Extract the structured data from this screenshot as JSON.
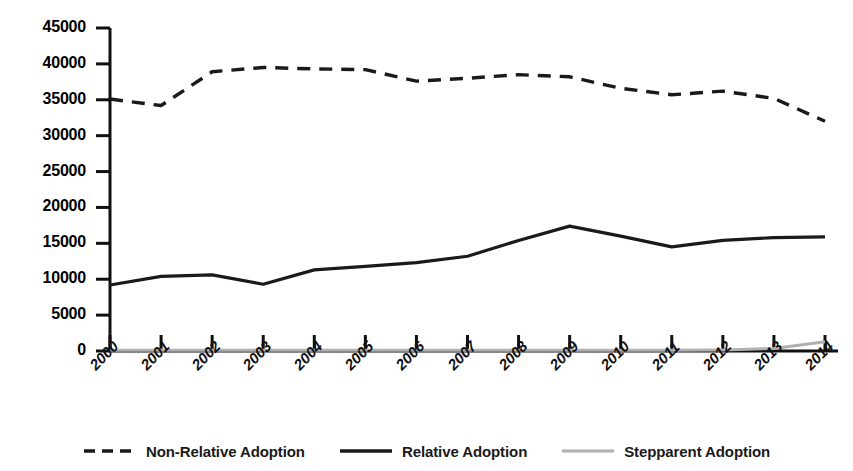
{
  "chart_data": {
    "type": "line",
    "title": "",
    "xlabel": "",
    "ylabel": "",
    "categories": [
      "2000",
      "2001",
      "2002",
      "2003",
      "2004",
      "2005",
      "2006",
      "2007",
      "2008",
      "2009",
      "2010",
      "2011",
      "2012",
      "2013",
      "2014"
    ],
    "ylim": [
      0,
      45000
    ],
    "yticks": [
      0,
      5000,
      10000,
      15000,
      20000,
      25000,
      30000,
      35000,
      40000,
      45000
    ],
    "ytick_labels": [
      "0",
      "5000",
      "10000",
      "15000",
      "20000",
      "25000",
      "30000",
      "35000",
      "40000",
      "45000"
    ],
    "grid": false,
    "legend_position": "bottom",
    "series": [
      {
        "name": "Non-Relative Adoption",
        "style": "dashed",
        "color": "#1a1a1a",
        "values": [
          35100,
          34200,
          38900,
          39500,
          39300,
          39200,
          37600,
          38000,
          38500,
          38200,
          36600,
          35700,
          36200,
          35200,
          32000
        ]
      },
      {
        "name": "Relative Adoption",
        "style": "solid",
        "color": "#1a1a1a",
        "values": [
          9200,
          10400,
          10600,
          9300,
          11300,
          11800,
          12300,
          13200,
          15400,
          17400,
          16000,
          14500,
          15400,
          15800,
          15900
        ]
      },
      {
        "name": "Stepparent Adoption",
        "style": "solid",
        "color": "#b0b0b0",
        "values": [
          100,
          100,
          100,
          100,
          100,
          100,
          100,
          100,
          100,
          100,
          100,
          100,
          150,
          350,
          1300
        ]
      }
    ]
  },
  "legend": {
    "items": [
      {
        "label": "Non-Relative Adoption",
        "icon": "dashed-line-swatch"
      },
      {
        "label": "Relative Adoption",
        "icon": "solid-line-swatch"
      },
      {
        "label": "Stepparent Adoption",
        "icon": "gray-line-swatch"
      }
    ]
  },
  "axes": {
    "y_axis_name": "y-axis",
    "x_axis_name": "x-axis"
  }
}
